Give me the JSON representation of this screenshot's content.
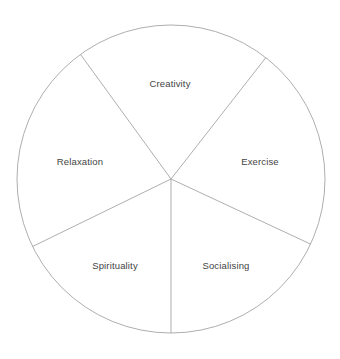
{
  "figure": {
    "title": "",
    "background_color": "#ffffff",
    "stroke_color": "#a5a5a5",
    "text_color": "#434343",
    "stroke_width": 0.9
  },
  "chart_data": {
    "type": "pie",
    "title": "",
    "subtitle": "",
    "xlabel": "",
    "ylabel": "",
    "legend": "none",
    "grid": false,
    "center": {
      "cx": 171,
      "cy": 179
    },
    "radius": 154,
    "equal_slices": false,
    "categories": [
      "Creativity",
      "Exercise",
      "Socialising",
      "Spirituality",
      "Relaxation"
    ],
    "values": [
      20,
      20,
      20,
      20,
      20
    ],
    "slices": [
      {
        "label": "Creativity",
        "value": 20,
        "start_angle_deg": 52,
        "end_angle_deg": 126,
        "label_x": 170,
        "label_y": 84
      },
      {
        "label": "Exercise",
        "value": 20,
        "start_angle_deg": -25,
        "end_angle_deg": 52,
        "label_x": 260,
        "label_y": 162
      },
      {
        "label": "Socialising",
        "value": 20,
        "start_angle_deg": -90,
        "end_angle_deg": -25,
        "label_x": 226,
        "label_y": 266
      },
      {
        "label": "Spirituality",
        "value": 20,
        "start_angle_deg": -154,
        "end_angle_deg": -90,
        "label_x": 115,
        "label_y": 266
      },
      {
        "label": "Relaxation",
        "value": 20,
        "start_angle_deg": 126,
        "end_angle_deg": 206,
        "label_x": 80,
        "label_y": 162
      }
    ]
  }
}
